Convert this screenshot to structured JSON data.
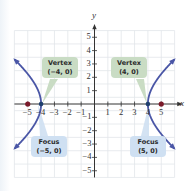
{
  "chart_data": {
    "type": "line",
    "title": "",
    "equation": "x^2/16 - y^2/9 = 1",
    "xlabel": "x",
    "ylabel": "y",
    "xlim": [
      -6,
      6
    ],
    "ylim": [
      -5.5,
      5.5
    ],
    "grid": true,
    "x_ticks": [
      -5,
      -4,
      -3,
      -2,
      -1,
      1,
      2,
      3,
      4,
      5
    ],
    "y_ticks": [
      -5,
      -4,
      -3,
      -2,
      -1,
      1,
      2,
      3,
      4,
      5
    ],
    "x_tick_labels": [
      "−5",
      "−4",
      "−3",
      "−2",
      "−1",
      "1",
      "2",
      "3",
      "4",
      "5"
    ],
    "y_tick_labels": [
      "−5",
      "−4",
      "−3",
      "−2",
      "−1",
      "1",
      "2",
      "3",
      "4",
      "5"
    ],
    "series": [
      {
        "name": "right branch",
        "color": "#4a56a6",
        "y_range": [
          -3.35,
          3.35
        ]
      },
      {
        "name": "left branch",
        "color": "#4a56a6",
        "y_range": [
          -3.35,
          3.35
        ]
      }
    ],
    "points": [
      {
        "label": "Vertex",
        "coords": "(−4, 0)",
        "x": -4,
        "y": 0,
        "color": "#1f3f6e"
      },
      {
        "label": "Vertex",
        "coords": "(4, 0)",
        "x": 4,
        "y": 0,
        "color": "#1f3f6e"
      },
      {
        "label": "Focus",
        "coords": "(−5, 0)",
        "x": -5,
        "y": 0,
        "color": "#7a1a2a"
      },
      {
        "label": "Focus",
        "coords": "(5, 0)",
        "x": 5,
        "y": 0,
        "color": "#7a1a2a"
      }
    ]
  },
  "axes": {
    "x_label": "x",
    "y_label": "y"
  },
  "ticks": {
    "x": [
      {
        "label": "−5",
        "v": -5
      },
      {
        "label": "−4",
        "v": -4
      },
      {
        "label": "−3",
        "v": -3
      },
      {
        "label": "−2",
        "v": -2
      },
      {
        "label": "−1",
        "v": -1
      },
      {
        "label": "1",
        "v": 1
      },
      {
        "label": "2",
        "v": 2
      },
      {
        "label": "3",
        "v": 3
      },
      {
        "label": "4",
        "v": 4
      },
      {
        "label": "5",
        "v": 5
      }
    ],
    "y": [
      {
        "label": "5",
        "v": 5
      },
      {
        "label": "4",
        "v": 4
      },
      {
        "label": "3",
        "v": 3
      },
      {
        "label": "2",
        "v": 2
      },
      {
        "label": "1",
        "v": 1
      },
      {
        "label": "−1",
        "v": -1
      },
      {
        "label": "−2",
        "v": -2
      },
      {
        "label": "−3",
        "v": -3
      },
      {
        "label": "−4",
        "v": -4
      },
      {
        "label": "−5",
        "v": -5
      }
    ]
  },
  "callouts": {
    "vertex_left": {
      "title": "Vertex",
      "coords": "(−4, 0)"
    },
    "vertex_right": {
      "title": "Vertex",
      "coords": "(4, 0)"
    },
    "focus_left": {
      "title": "Focus",
      "coords": "(−5, 0)"
    },
    "focus_right": {
      "title": "Focus",
      "coords": "(5, 0)"
    }
  },
  "colors": {
    "curve": "#4a56a6",
    "vertex_fill": "#c9dcc4",
    "focus_fill": "#cfe0f2",
    "focus_point": "#7a1a2a",
    "grid": "#e2e6ea",
    "axis": "#333333"
  }
}
